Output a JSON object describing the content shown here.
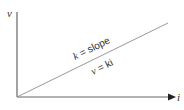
{
  "diagram": {
    "type": "linear-graph",
    "y_axis_label": "v",
    "x_axis_label": "i",
    "slope_label_var": "k",
    "slope_label_rest": " = slope",
    "equation_label_var1": "v",
    "equation_label_rest": " = ki",
    "colors": {
      "axis": "#555555",
      "line": "#8a8a8a",
      "text": "#333333"
    }
  }
}
